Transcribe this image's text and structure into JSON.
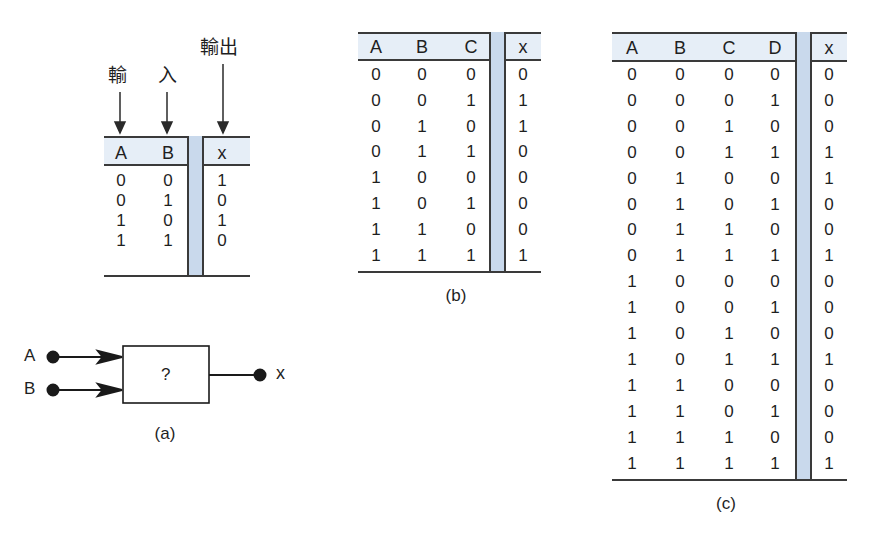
{
  "figure_a": {
    "labels": {
      "input": "輸　入",
      "input_1": "輸",
      "input_2": "入",
      "output": "輸出"
    },
    "table": {
      "headers": [
        "A",
        "B",
        "x"
      ],
      "rows": [
        [
          "0",
          "0",
          "1"
        ],
        [
          "0",
          "1",
          "0"
        ],
        [
          "1",
          "0",
          "1"
        ],
        [
          "1",
          "1",
          "0"
        ]
      ]
    },
    "diagram": {
      "input_a": "A",
      "input_b": "B",
      "block": "?",
      "output": "x"
    },
    "caption": "(a)"
  },
  "figure_b": {
    "table": {
      "headers": [
        "A",
        "B",
        "C",
        "x"
      ],
      "rows": [
        [
          "0",
          "0",
          "0",
          "0"
        ],
        [
          "0",
          "0",
          "1",
          "1"
        ],
        [
          "0",
          "1",
          "0",
          "1"
        ],
        [
          "0",
          "1",
          "1",
          "0"
        ],
        [
          "1",
          "0",
          "0",
          "0"
        ],
        [
          "1",
          "0",
          "1",
          "0"
        ],
        [
          "1",
          "1",
          "0",
          "0"
        ],
        [
          "1",
          "1",
          "1",
          "1"
        ]
      ]
    },
    "caption": "(b)"
  },
  "figure_c": {
    "table": {
      "headers": [
        "A",
        "B",
        "C",
        "D",
        "x"
      ],
      "rows": [
        [
          "0",
          "0",
          "0",
          "0",
          "0"
        ],
        [
          "0",
          "0",
          "0",
          "1",
          "0"
        ],
        [
          "0",
          "0",
          "1",
          "0",
          "0"
        ],
        [
          "0",
          "0",
          "1",
          "1",
          "1"
        ],
        [
          "0",
          "1",
          "0",
          "0",
          "1"
        ],
        [
          "0",
          "1",
          "0",
          "1",
          "0"
        ],
        [
          "0",
          "1",
          "1",
          "0",
          "0"
        ],
        [
          "0",
          "1",
          "1",
          "1",
          "1"
        ],
        [
          "1",
          "0",
          "0",
          "0",
          "0"
        ],
        [
          "1",
          "0",
          "0",
          "1",
          "0"
        ],
        [
          "1",
          "0",
          "1",
          "0",
          "0"
        ],
        [
          "1",
          "0",
          "1",
          "1",
          "1"
        ],
        [
          "1",
          "1",
          "0",
          "0",
          "0"
        ],
        [
          "1",
          "1",
          "0",
          "1",
          "0"
        ],
        [
          "1",
          "1",
          "1",
          "0",
          "0"
        ],
        [
          "1",
          "1",
          "1",
          "1",
          "1"
        ]
      ]
    },
    "caption": "(c)"
  },
  "colors": {
    "header_bg": "#e6eef7",
    "separator_column": "#c9d9ec",
    "line": "#3a3a3a",
    "text": "#1f1f1f"
  }
}
